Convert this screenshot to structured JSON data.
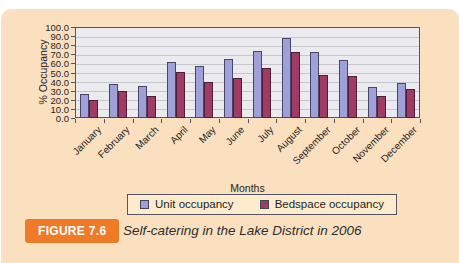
{
  "figure": {
    "badge_label": "FIGURE 7.6",
    "caption": "Self-catering in the Lake District in 2006"
  },
  "chart_data": {
    "type": "bar",
    "title": "",
    "categories": [
      "January",
      "February",
      "March",
      "April",
      "May",
      "June",
      "July",
      "August",
      "September",
      "October",
      "November",
      "December"
    ],
    "series": [
      {
        "name": "Unit occupancy",
        "color": "#a0a0d8",
        "border": "#46466b",
        "values": [
          26,
          37,
          35,
          62,
          57,
          65,
          74,
          88,
          73,
          64,
          34,
          38
        ]
      },
      {
        "name": "Bedspace occupancy",
        "color": "#a03c64",
        "border": "#4b1f38",
        "values": [
          20,
          30,
          24,
          50,
          40,
          44,
          55,
          73,
          47,
          46,
          24,
          32
        ]
      }
    ],
    "xlabel": "Months",
    "ylabel": "% Occupancy",
    "ylim": [
      0,
      100
    ],
    "yticks": [
      "0.0",
      "10.0",
      "20.0",
      "30.0",
      "40.0",
      "50.0",
      "60.0",
      "70.0",
      "80.0",
      "90.0",
      "100.0"
    ],
    "grid": true,
    "legend_position": "bottom"
  },
  "colors": {
    "page_bg": "#ffffff",
    "card_bg": "#fbe0c0",
    "plot_bg": "#eaeaef",
    "gridline": "#c6c6cd",
    "axis": "#55555f",
    "legend_bg": "#fceccd",
    "badge_bg": "#ef7a28",
    "badge_text": "#ffffff"
  }
}
